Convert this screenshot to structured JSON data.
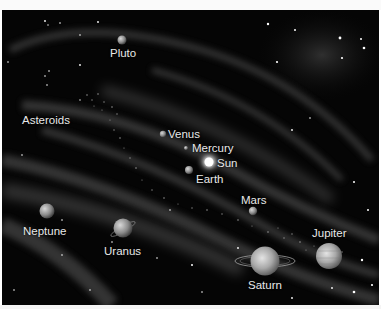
{
  "figure": {
    "title_fragment": "",
    "background_color": "#050505",
    "labels": {
      "pluto": "Pluto",
      "asteroids": "Asteroids",
      "venus": "Venus",
      "mercury": "Mercury",
      "sun": "Sun",
      "earth": "Earth",
      "mars": "Mars",
      "neptune": "Neptune",
      "uranus": "Uranus",
      "jupiter": "Jupiter",
      "saturn": "Saturn"
    }
  }
}
